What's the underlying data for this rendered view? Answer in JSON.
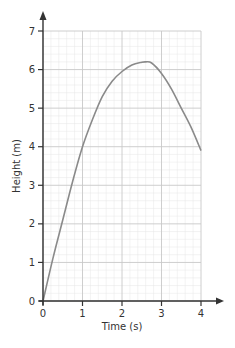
{
  "chart_data": {
    "type": "line",
    "title": "",
    "xlabel": "Time (s)",
    "ylabel": "Height (m)",
    "xlim": [
      0,
      4
    ],
    "ylim": [
      0,
      7
    ],
    "xticks": [
      0,
      1,
      2,
      3,
      4
    ],
    "yticks": [
      0,
      1,
      2,
      3,
      4,
      5,
      6,
      7
    ],
    "grid": {
      "major_step": 1,
      "minor_step": 0.2,
      "on": true
    },
    "legend": null,
    "series": [
      {
        "name": "height",
        "x": [
          0,
          0.25,
          0.5,
          0.75,
          1.0,
          1.25,
          1.5,
          1.75,
          2.0,
          2.25,
          2.5,
          2.6,
          2.75,
          3.0,
          3.25,
          3.5,
          3.75,
          4.0
        ],
        "y": [
          0,
          1.1,
          2.1,
          3.1,
          4.0,
          4.7,
          5.3,
          5.7,
          5.95,
          6.12,
          6.19,
          6.2,
          6.17,
          5.9,
          5.5,
          5.0,
          4.5,
          3.9
        ]
      }
    ]
  },
  "colors": {
    "curve": "#8a8a8a",
    "axis": "#333333",
    "grid_major": "#c8c8c8",
    "grid_minor": "#e6e6e6"
  }
}
